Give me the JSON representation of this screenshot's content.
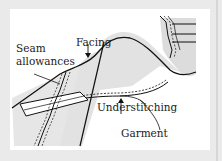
{
  "diagram": {
    "labels": {
      "seam_allowances_line1": "Seam",
      "seam_allowances_line2": "allowances",
      "facing": "Facing",
      "understitching": "Understitching",
      "garment": "Garment"
    },
    "colors": {
      "background": "#eaeaea",
      "panel": "#ffffff",
      "shade": "#dcdcdc",
      "ink": "#111111"
    }
  }
}
